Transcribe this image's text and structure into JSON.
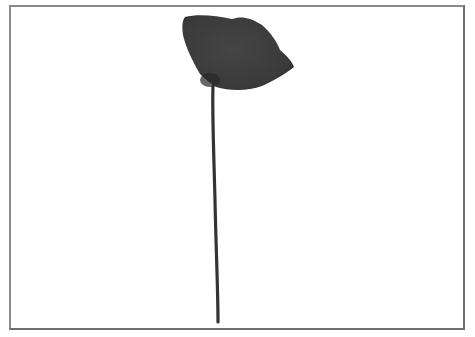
{
  "image": {
    "subject": "Single poppy flower with long thin stem on white background",
    "alt": "Black and white photo of a poppy flower",
    "colors": {
      "background": "#ffffff",
      "frame_border": "#7a7a7a",
      "petal": "#3d3d3d",
      "petal_shadow": "#2a2a2a",
      "stem": "#333333"
    }
  }
}
